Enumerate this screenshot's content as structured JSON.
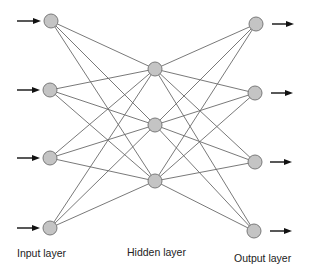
{
  "colors": {
    "node_fill": "#c4c4c4",
    "node_stroke": "#7a7a7a",
    "edge": "#6a6a6a",
    "arrow": "#111111",
    "text": "#222222"
  },
  "layers": {
    "input": {
      "label": "Input layer",
      "label_pos": [
        17,
        247
      ],
      "nodes": [
        [
          51,
          21
        ],
        [
          50,
          90
        ],
        [
          50,
          158
        ],
        [
          50,
          228
        ]
      ],
      "arrows": [
        [
          17,
          21,
          41,
          21
        ],
        [
          17,
          90,
          40,
          90
        ],
        [
          17,
          158,
          40,
          158
        ],
        [
          17,
          228,
          40,
          228
        ]
      ]
    },
    "hidden": {
      "label": "Hidden layer",
      "label_pos": [
        127,
        246
      ],
      "nodes": [
        [
          155,
          69
        ],
        [
          155,
          125
        ],
        [
          155,
          181
        ]
      ]
    },
    "output": {
      "label": "Output layer",
      "label_pos": [
        234,
        252
      ],
      "nodes": [
        [
          256,
          24
        ],
        [
          255,
          93
        ],
        [
          255,
          162
        ],
        [
          254,
          231
        ]
      ],
      "arrows": [
        [
          272,
          24,
          294,
          24
        ],
        [
          271,
          93,
          293,
          93
        ],
        [
          270,
          162,
          292,
          162
        ],
        [
          270,
          231,
          292,
          231
        ]
      ]
    }
  },
  "node_radius": 7
}
